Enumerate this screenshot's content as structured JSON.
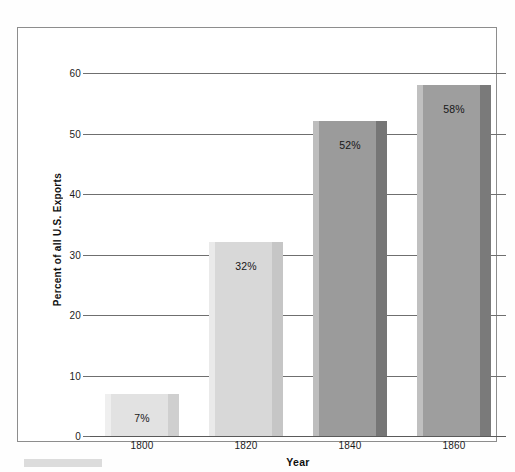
{
  "chart_data": {
    "type": "bar",
    "title": "",
    "xlabel": "Year",
    "ylabel": "Percent of all U.S. Exports",
    "categories": [
      "1800",
      "1820",
      "1840",
      "1860"
    ],
    "values": [
      7,
      32,
      52,
      58
    ],
    "value_labels": [
      "7%",
      "32%",
      "52%",
      "58%"
    ],
    "ylim": [
      0,
      60
    ],
    "ytick_values": [
      0,
      10,
      20,
      30,
      40,
      50,
      60
    ],
    "ytick_labels": [
      "0",
      "10",
      "20",
      "30",
      "40",
      "50",
      "60"
    ],
    "grid": true,
    "legend": false,
    "legend_position": "none",
    "bar_colors": [
      "#e2e2e2",
      "#d8d8d8",
      "#9b9b9b",
      "#9e9e9e"
    ],
    "bar_edge_light_colors": [
      "#efefef",
      "#eaeaea",
      "#bdbdbd",
      "#c0c0c0"
    ],
    "bar_edge_dark_colors": [
      "#cfcfcf",
      "#c6c6c6",
      "#767676",
      "#7a7a7a"
    ],
    "axis_color": "#6f6f6f",
    "text_color": "#1c1c1c",
    "background_color": "#ffffff"
  },
  "frame": {
    "border_color": "#8d8d8d"
  },
  "caption": {
    "swatch_color": "#dcdcdc"
  }
}
